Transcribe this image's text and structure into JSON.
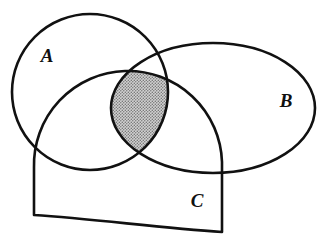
{
  "figure": {
    "kind": "venn-diagram",
    "background_color": "#ffffff",
    "stroke_color": "#111111",
    "stroke_width": 2.6,
    "width": 327,
    "height": 244
  },
  "sets": [
    {
      "id": "A",
      "label": "A",
      "shape": "circle",
      "label_x": 47,
      "label_y": 58,
      "cx": 90,
      "cy": 92,
      "r": 78
    },
    {
      "id": "B",
      "label": "B",
      "shape": "ellipse",
      "label_x": 286,
      "label_y": 103,
      "cx": 213,
      "cy": 108,
      "rx": 102,
      "ry": 65
    },
    {
      "id": "C",
      "label": "C",
      "shape": "arch",
      "label_x": 197,
      "label_y": 203,
      "path": "M 34 215 L 34 168 A 92 92 0 0 1 222 162 L 222 232 C 160 228 95 219 34 215 Z"
    }
  ],
  "shaded_region": {
    "name": "A-intersect-B-intersect-C",
    "description": "triple intersection of A, B and C",
    "fill_color": "#c9c9c9",
    "fill_pattern": "dot-stipple",
    "pattern_dot_color": "#6e6e6e",
    "path": "M 101 127 C 118 118 140 117 156 126 C 150 146 139 160 124 168 C 110 157 102 143 101 127 Z"
  },
  "legend": {
    "shaded_meaning": "A ∩ B ∩ C"
  }
}
